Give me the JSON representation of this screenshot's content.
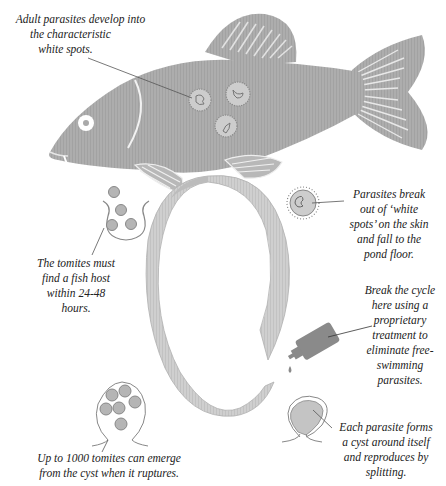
{
  "diagram": {
    "colors": {
      "fish_body": "#a9a9a9",
      "ring": "#c8c8c8",
      "ring_edge": "#b0b0b0",
      "bottle": "#8a8a8a",
      "spot_fill": "#c9c9c9",
      "text": "#222222",
      "leader_line": "#555555",
      "background": "#ffffff"
    },
    "labels": {
      "adult_parasites": {
        "lines": [
          "Adult parasites develop into",
          "the characteristic",
          "white spots."
        ]
      },
      "break_out": {
        "lines": [
          "Parasites break",
          "out of ‘white",
          "spots’ on the skin",
          "and fall to the",
          "pond floor."
        ]
      },
      "tomites_host": {
        "lines": [
          "The tomites must",
          "find a fish host",
          "within 24-48",
          "hours."
        ]
      },
      "treatment": {
        "lines": [
          "Break the cycle",
          "here using a",
          "proprietary",
          "treatment to",
          "eliminate free-",
          "swimming",
          "parasites."
        ]
      },
      "cyst_rupture": {
        "lines": [
          "Up to 1000 tomites can emerge",
          "from the cyst when it ruptures."
        ]
      },
      "cyst_forms": {
        "lines": [
          "Each parasite forms",
          "a cyst around itself",
          "and reproduces by",
          "splitting."
        ]
      }
    },
    "icons": {
      "fish": "fish-illustration",
      "white_spot": "parasite-spot-icon",
      "free_parasite": "free-parasite-icon",
      "tomites": "tomites-icon",
      "bottle": "treatment-bottle-icon",
      "cyst": "cyst-icon",
      "ruptured_cyst": "ruptured-cyst-icon",
      "cycle": "cycle-ring"
    }
  }
}
